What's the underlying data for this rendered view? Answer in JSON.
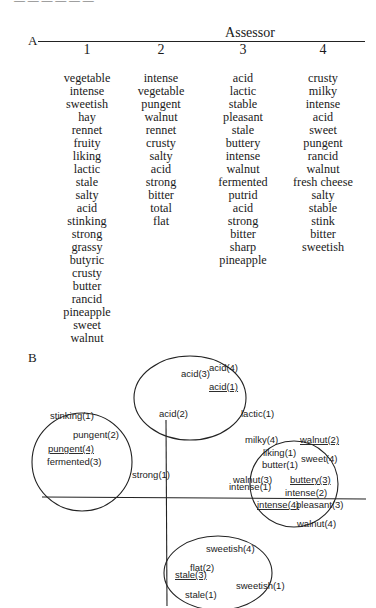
{
  "header_fragment": "— — — — — —",
  "panel_a": {
    "label": "A",
    "title": "Assessor",
    "columns": [
      {
        "number": "1",
        "terms": [
          "vegetable",
          "intense",
          "sweetish",
          "hay",
          "rennet",
          "fruity",
          "liking",
          "lactic",
          "stale",
          "salty",
          "acid",
          "stinking",
          "strong",
          "grassy",
          "butyric",
          "crusty",
          "butter",
          "rancid",
          "pineapple",
          "sweet",
          "walnut"
        ]
      },
      {
        "number": "2",
        "terms": [
          "intense",
          "vegetable",
          "pungent",
          "walnut",
          "rennet",
          "crusty",
          "salty",
          "acid",
          "strong",
          "bitter",
          "total",
          "flat"
        ]
      },
      {
        "number": "3",
        "terms": [
          "acid",
          "lactic",
          "stable",
          "pleasant",
          "stale",
          "buttery",
          "intense",
          "walnut",
          "fermented",
          "putrid",
          "acid",
          "strong",
          "bitter",
          "sharp",
          "pineapple"
        ]
      },
      {
        "number": "4",
        "terms": [
          "crusty",
          "milky",
          "intense",
          "acid",
          "sweet",
          "pungent",
          "rancid",
          "walnut",
          "fresh cheese",
          "salty",
          "stable",
          "stink",
          "bitter",
          "sweetish"
        ]
      }
    ]
  },
  "panel_b": {
    "label": "B",
    "clusters": [
      {
        "name": "pungent-cluster",
        "cx": 82,
        "cy": 462,
        "rx": 50,
        "ry": 49
      },
      {
        "name": "acid-cluster",
        "cx": 190,
        "cy": 398,
        "rx": 56,
        "ry": 42
      },
      {
        "name": "buttery-cluster",
        "cx": 294,
        "cy": 484,
        "rx": 44,
        "ry": 43
      },
      {
        "name": "sweetish-cluster",
        "cx": 218,
        "cy": 573,
        "rx": 54,
        "ry": 37
      }
    ],
    "points": [
      {
        "text": "stinking(1)",
        "x": 50,
        "y": 419,
        "underline": false
      },
      {
        "text": "pungent(2)",
        "x": 73,
        "y": 438,
        "underline": false
      },
      {
        "text": "pungent(4)",
        "x": 48,
        "y": 452,
        "underline": true
      },
      {
        "text": "fermented(3)",
        "x": 47,
        "y": 465,
        "underline": false
      },
      {
        "text": "strong(1)",
        "x": 132,
        "y": 478,
        "underline": false
      },
      {
        "text": "acid(4)",
        "x": 209,
        "y": 371,
        "underline": false
      },
      {
        "text": "acid(3)",
        "x": 181,
        "y": 377,
        "underline": false
      },
      {
        "text": "acid(1)",
        "x": 209,
        "y": 390,
        "underline": true
      },
      {
        "text": "acid(2)",
        "x": 159,
        "y": 417,
        "underline": false
      },
      {
        "text": "lactic(1)",
        "x": 241,
        "y": 417,
        "underline": false
      },
      {
        "text": "milky(4)",
        "x": 245,
        "y": 443,
        "underline": false
      },
      {
        "text": "walnut(2)",
        "x": 300,
        "y": 443,
        "underline": true
      },
      {
        "text": "liking(1)",
        "x": 263,
        "y": 456,
        "underline": false
      },
      {
        "text": "sweet(4)",
        "x": 301,
        "y": 462,
        "underline": false
      },
      {
        "text": "butter(1)",
        "x": 262,
        "y": 468,
        "underline": false
      },
      {
        "text": "walnut(3)",
        "x": 233,
        "y": 483,
        "underline": false
      },
      {
        "text": "intense(1)",
        "x": 229,
        "y": 490,
        "underline": false
      },
      {
        "text": "buttery(3)",
        "x": 290,
        "y": 483,
        "underline": true
      },
      {
        "text": "intense(2)",
        "x": 285,
        "y": 496,
        "underline": false
      },
      {
        "text": "intense(4)",
        "x": 257,
        "y": 508,
        "underline": true
      },
      {
        "text": "pleasant(3)",
        "x": 296,
        "y": 508,
        "underline": false
      },
      {
        "text": "walnut(4)",
        "x": 297,
        "y": 527,
        "underline": false
      },
      {
        "text": "sweetish(4)",
        "x": 206,
        "y": 552,
        "underline": false
      },
      {
        "text": "flat(2)",
        "x": 190,
        "y": 571,
        "underline": false
      },
      {
        "text": "stale(3)",
        "x": 175,
        "y": 578,
        "underline": true
      },
      {
        "text": "sweetish(1)",
        "x": 236,
        "y": 589,
        "underline": false
      },
      {
        "text": "stale(1)",
        "x": 185,
        "y": 598,
        "underline": false
      }
    ]
  }
}
